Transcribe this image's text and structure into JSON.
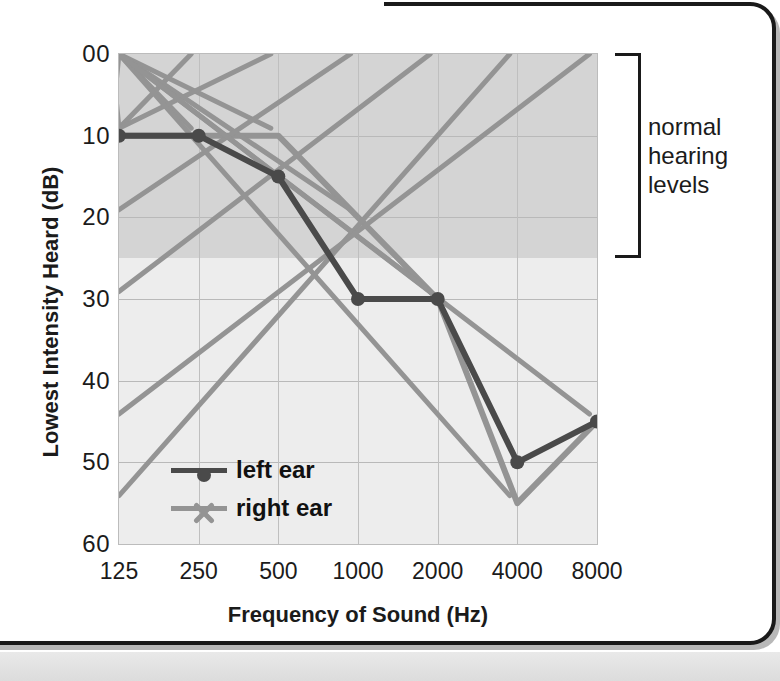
{
  "chart_data": {
    "type": "line",
    "title": "",
    "xlabel": "Frequency of Sound (Hz)",
    "ylabel": "Lowest Intensity Heard (dB)",
    "categories": [
      "125",
      "250",
      "500",
      "1000",
      "2000",
      "4000",
      "8000"
    ],
    "x_tick_labels": [
      "125",
      "250",
      "500",
      "1000",
      "2000",
      "4000",
      "8000"
    ],
    "y_tick_labels": [
      "00",
      "10",
      "20",
      "30",
      "40",
      "50",
      "60"
    ],
    "y_tick_values": [
      0,
      10,
      20,
      30,
      40,
      50,
      60
    ],
    "ylim": [
      0,
      60
    ],
    "y_inverted": true,
    "grid": true,
    "legend_position": "inside-bottom-left",
    "series": [
      {
        "name": "left ear",
        "color": "#4a4a4a",
        "marker": "circle",
        "values": [
          10,
          10,
          15,
          30,
          30,
          50,
          45
        ]
      },
      {
        "name": "right ear",
        "color": "#949494",
        "marker": "x",
        "values": [
          10,
          10,
          10,
          20,
          30,
          55,
          45
        ]
      }
    ],
    "shaded_band": {
      "label": "normal hearing levels",
      "from_db": 0,
      "to_db": 25,
      "color": "#d4d4d4"
    },
    "annotations": [
      {
        "name": "normal-hearing-bracket",
        "lines": [
          "normal",
          "hearing",
          "levels"
        ],
        "spans_db": [
          0,
          25
        ]
      }
    ]
  },
  "axes": {
    "y_title": "Lowest Intensity Heard (dB)",
    "x_title": "Frequency of Sound (Hz)"
  },
  "legend": {
    "items": [
      {
        "label": "left ear",
        "color": "#4a4a4a",
        "marker": "circle"
      },
      {
        "label": "right ear",
        "color": "#949494",
        "marker": "x"
      }
    ]
  },
  "annotation": {
    "line1": "normal",
    "line2": "hearing",
    "line3": "levels"
  },
  "colors": {
    "left_ear": "#4a4a4a",
    "right_ear": "#949494",
    "band_normal": "#d4d4d4",
    "plot_background": "#ededed",
    "gridline": "#b9b9b9",
    "text": "#1b1b1b"
  }
}
